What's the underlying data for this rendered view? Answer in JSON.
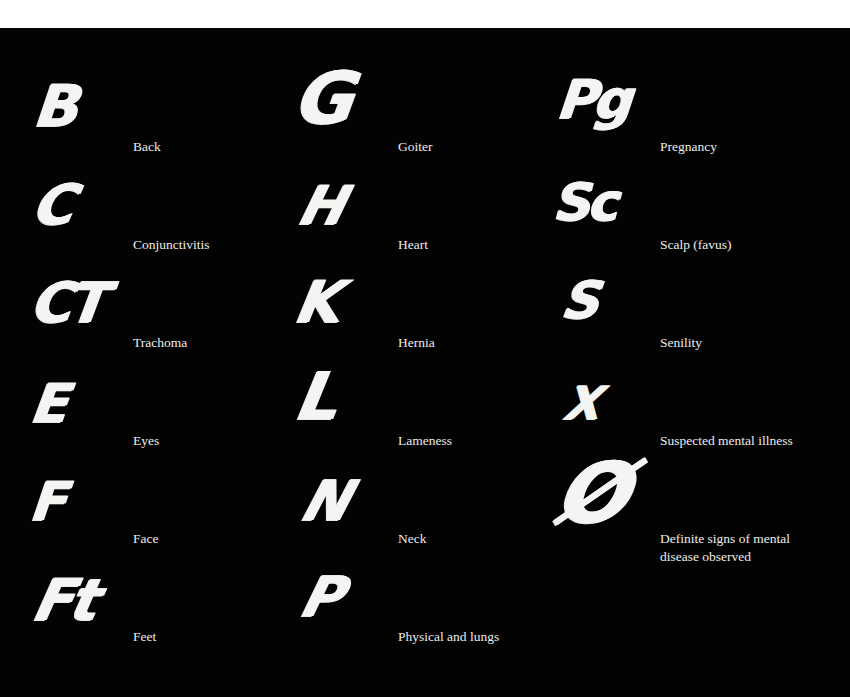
{
  "page": {
    "background_top": "#ffffff",
    "panel_background": "#030303",
    "text_color": "#ececea"
  },
  "codes": [
    {
      "code": "B",
      "label": "Back"
    },
    {
      "code": "C",
      "label": "Conjunctivitis"
    },
    {
      "code": "CT",
      "label": "Trachoma"
    },
    {
      "code": "E",
      "label": "Eyes"
    },
    {
      "code": "F",
      "label": "Face"
    },
    {
      "code": "Ft",
      "label": "Feet"
    },
    {
      "code": "G",
      "label": "Goiter"
    },
    {
      "code": "H",
      "label": "Heart"
    },
    {
      "code": "K",
      "label": "Hernia"
    },
    {
      "code": "L",
      "label": "Lameness"
    },
    {
      "code": "N",
      "label": "Neck"
    },
    {
      "code": "P",
      "label": "Physical and lungs"
    },
    {
      "code": "Pg",
      "label": "Pregnancy"
    },
    {
      "code": "Sc",
      "label": "Scalp (favus)"
    },
    {
      "code": "S",
      "label": "Senility"
    },
    {
      "code": "X",
      "label": "Suspected mental illness"
    },
    {
      "code": "Ø",
      "label": "Definite signs of mental disease observed"
    }
  ]
}
